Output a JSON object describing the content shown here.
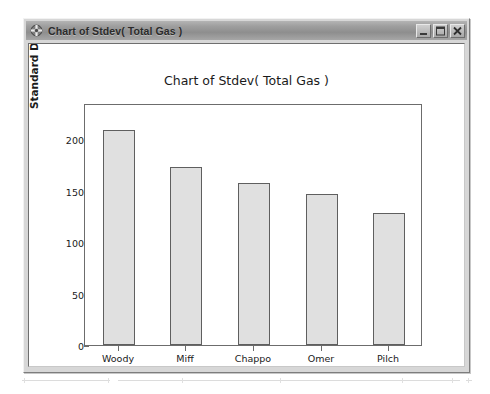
{
  "window": {
    "title": "Chart of Stdev( Total Gas )",
    "icon": "crosshair-circle-icon",
    "buttons": {
      "minimize": "Minimize",
      "maximize": "Maximize",
      "close": "Close"
    }
  },
  "chart_data": {
    "type": "bar",
    "title": "Chart of Stdev( Total Gas )",
    "xlabel": "Person",
    "ylabel": "Standard Deviation of Total Gas",
    "categories": [
      "Woody",
      "Miff",
      "Chappo",
      "Omer",
      "Pilch"
    ],
    "values": [
      209,
      173,
      157,
      147,
      128
    ],
    "ylim": [
      0,
      235
    ],
    "yticks": [
      0,
      50,
      100,
      150,
      200
    ],
    "ytick_labels": [
      "0",
      "50",
      "100",
      "150",
      "200"
    ],
    "grid": false,
    "legend": false,
    "bar_fill": "#e0e0e0",
    "bar_border": "#5f5f5f",
    "plot_background": "#ffffff"
  }
}
